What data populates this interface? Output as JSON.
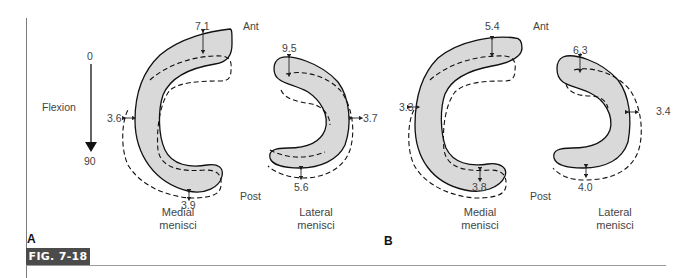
{
  "figure": {
    "label": "FIG. 7-18",
    "badge_color": "#4b4b4b",
    "fill_color": "#d9d9d9"
  },
  "flexion_axis": {
    "label": "Flexion",
    "start": "0",
    "end": "90"
  },
  "panels": [
    {
      "letter": "A",
      "ant_label": "Ant",
      "post_label": "Post",
      "medial": {
        "caption_line1": "Medial",
        "caption_line2": "menisci",
        "anterior": "7.1",
        "peripheral": "3.6",
        "posterior": "3.9"
      },
      "lateral": {
        "caption_line1": "Lateral",
        "caption_line2": "menisci",
        "anterior": "9.5",
        "peripheral": "3.7",
        "posterior": "5.6"
      }
    },
    {
      "letter": "B",
      "ant_label": "Ant",
      "post_label": "Post",
      "medial": {
        "caption_line1": "Medial",
        "caption_line2": "menisci",
        "anterior": "5.4",
        "peripheral": "3.3",
        "posterior": "3.8"
      },
      "lateral": {
        "caption_line1": "Lateral",
        "caption_line2": "menisci",
        "anterior": "6.3",
        "peripheral": "3.4",
        "posterior": "4.0"
      }
    }
  ]
}
